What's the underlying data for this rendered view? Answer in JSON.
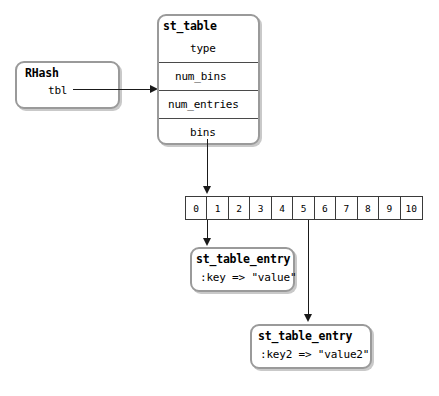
{
  "diagram": {
    "background_color": "#ffffff",
    "line_color": "#1a1a1a",
    "box_border_color": "#9a9a9a",
    "box_shadow_color": "#c9c9c9"
  },
  "rhash_box": {
    "title": "RHash",
    "fields": [
      {
        "label": "tbl"
      }
    ]
  },
  "st_table_box": {
    "title": "st_table",
    "fields": [
      {
        "label": "type"
      },
      {
        "label": "num_bins"
      },
      {
        "label": "num_entries"
      },
      {
        "label": "bins"
      }
    ]
  },
  "bins_array": {
    "name": "bins-array",
    "cells": [
      "0",
      "1",
      "2",
      "3",
      "4",
      "5",
      "6",
      "7",
      "8",
      "9",
      "10"
    ],
    "linked_cells": [
      "2",
      "5"
    ]
  },
  "entry_boxes": [
    {
      "title": "st_table_entry",
      "pair": ":key => \"value\"",
      "from_cell": "2"
    },
    {
      "title": "st_table_entry",
      "pair": ":key2 => \"value2\"",
      "from_cell": "5"
    }
  ]
}
